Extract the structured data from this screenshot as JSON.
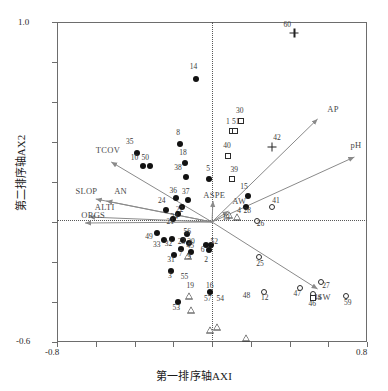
{
  "chart_data": {
    "type": "scatter",
    "title": "",
    "xlabel": "第一排序轴AXI",
    "ylabel": "第二排序轴AX2",
    "xlim": [
      -0.8,
      0.8
    ],
    "ylim": [
      -0.6,
      1.0
    ],
    "xticks": [
      -0.8,
      -0.6,
      -0.4,
      -0.2,
      0.0,
      0.2,
      0.4,
      0.6,
      0.8
    ],
    "yticks": [
      -0.6,
      -0.4,
      -0.2,
      0.0,
      0.2,
      0.4,
      0.6,
      0.8,
      1.0
    ],
    "xtick_labels": [
      "-0.8",
      "",
      "",
      "",
      "",
      "",
      "",
      "",
      "0.8"
    ],
    "ytick_labels": [
      "-0.6",
      "",
      "",
      "",
      "",
      "",
      "",
      "",
      "1.0"
    ],
    "grid": false,
    "zero_lines": true,
    "legend": "none",
    "top_note": "",
    "environmental_vectors": [
      {
        "name": "TCOV",
        "x": -0.52,
        "y": 0.3,
        "label_x": -0.6,
        "label_y": 0.36
      },
      {
        "name": "SLOP",
        "x": -0.6,
        "y": 0.115,
        "label_x": -0.705,
        "label_y": 0.155
      },
      {
        "name": "AN",
        "x": -0.545,
        "y": 0.105,
        "label_x": -0.505,
        "label_y": 0.155
      },
      {
        "name": "ALTI",
        "x": -0.635,
        "y": 0.025,
        "label_x": -0.605,
        "label_y": 0.075
      },
      {
        "name": "ORGS",
        "x": -0.655,
        "y": -0.005,
        "label_x": -0.675,
        "label_y": 0.035
      },
      {
        "name": "AP",
        "x": 0.545,
        "y": 0.515,
        "label_x": 0.595,
        "label_y": 0.565
      },
      {
        "name": "pH",
        "x": 0.735,
        "y": 0.325,
        "label_x": 0.715,
        "label_y": 0.385
      },
      {
        "name": "AW",
        "x": 0.085,
        "y": 0.055,
        "label_x": 0.105,
        "label_y": 0.105
      },
      {
        "name": "ASPE",
        "x": 0.005,
        "y": 0.105,
        "label_x": -0.045,
        "label_y": 0.135
      },
      {
        "name": "SW",
        "x": 0.545,
        "y": -0.335,
        "label_x": 0.545,
        "label_y": -0.375
      }
    ],
    "marker_types": {
      "filled-circle": "Type A sample",
      "open-circle": "Type B sample",
      "open-square": "Type C sample",
      "open-triangle": "Type D sample",
      "plus": "Type E sample"
    },
    "points": [
      {
        "id": "14",
        "x": -0.085,
        "y": 0.715,
        "marker": "filled-circle",
        "lx": -0.095,
        "ly": 0.775
      },
      {
        "id": "60",
        "x": 0.425,
        "y": 0.945,
        "marker": "plus",
        "lx": 0.388,
        "ly": 0.985
      },
      {
        "id": "35",
        "x": -0.385,
        "y": 0.345,
        "marker": "filled-circle",
        "lx": -0.425,
        "ly": 0.4
      },
      {
        "id": "8",
        "x": -0.165,
        "y": 0.39,
        "marker": "filled-circle",
        "lx": -0.175,
        "ly": 0.445
      },
      {
        "id": "10",
        "x": -0.355,
        "y": 0.28,
        "marker": "filled-circle",
        "lx": -0.4,
        "ly": 0.32
      },
      {
        "id": "50",
        "x": -0.32,
        "y": 0.28,
        "marker": "filled-circle",
        "lx": -0.345,
        "ly": 0.32
      },
      {
        "id": "18",
        "x": -0.14,
        "y": 0.295,
        "marker": "filled-circle",
        "lx": -0.15,
        "ly": 0.345
      },
      {
        "id": "38",
        "x": -0.135,
        "y": 0.225,
        "marker": "filled-circle",
        "lx": -0.175,
        "ly": 0.268
      },
      {
        "id": "5",
        "x": -0.015,
        "y": 0.215,
        "marker": "filled-circle",
        "lx": -0.02,
        "ly": 0.265
      },
      {
        "id": "30",
        "x": 0.15,
        "y": 0.505,
        "marker": "open-square",
        "lx": 0.143,
        "ly": 0.555
      },
      {
        "id": "1",
        "x": 0.103,
        "y": 0.455,
        "marker": "open-square",
        "lx": 0.082,
        "ly": 0.5
      },
      {
        "id": "51",
        "x": 0.12,
        "y": 0.455,
        "marker": "open-square",
        "lx": 0.122,
        "ly": 0.5
      },
      {
        "id": "40",
        "x": 0.085,
        "y": 0.33,
        "marker": "open-square",
        "lx": 0.078,
        "ly": 0.382
      },
      {
        "id": "39",
        "x": 0.105,
        "y": 0.215,
        "marker": "open-square",
        "lx": 0.115,
        "ly": 0.258
      },
      {
        "id": "42",
        "x": 0.31,
        "y": 0.375,
        "marker": "plus",
        "lx": 0.335,
        "ly": 0.42
      },
      {
        "id": "24",
        "x": -0.235,
        "y": 0.06,
        "marker": "filled-circle",
        "lx": -0.26,
        "ly": 0.105
      },
      {
        "id": "37",
        "x": -0.125,
        "y": 0.11,
        "marker": "filled-circle",
        "lx": -0.135,
        "ly": 0.148
      },
      {
        "id": "36",
        "x": -0.185,
        "y": 0.118,
        "marker": "filled-circle",
        "lx": -0.2,
        "ly": 0.155
      },
      {
        "id": "22",
        "x": -0.155,
        "y": 0.075,
        "marker": "filled-circle",
        "lx": -0.168,
        "ly": 0.06
      },
      {
        "id": "34",
        "x": -0.175,
        "y": 0.038,
        "marker": "filled-circle",
        "lx": -0.195,
        "ly": 0.025
      },
      {
        "id": "21",
        "x": -0.2,
        "y": 0.015,
        "marker": "filled-circle",
        "lx": -0.215,
        "ly": 0.002
      },
      {
        "id": "13",
        "x": 0.09,
        "y": 0.035,
        "marker": "open-triangle",
        "lx": 0.072,
        "ly": 0.018
      },
      {
        "id": "4",
        "x": 0.128,
        "y": 0.06,
        "marker": "open-triangle",
        "lx": 0.14,
        "ly": 0.055
      },
      {
        "id": "15",
        "x": 0.185,
        "y": 0.13,
        "marker": "filled-circle",
        "lx": 0.165,
        "ly": 0.175
      },
      {
        "id": "28",
        "x": 0.175,
        "y": 0.075,
        "marker": "filled-circle",
        "lx": 0.182,
        "ly": 0.055
      },
      {
        "id": "41",
        "x": 0.31,
        "y": 0.075,
        "marker": "open-circle",
        "lx": 0.33,
        "ly": 0.105
      },
      {
        "id": "26",
        "x": 0.23,
        "y": 0.005,
        "marker": "open-circle",
        "lx": 0.25,
        "ly": -0.012
      },
      {
        "id": "49",
        "x": -0.285,
        "y": -0.055,
        "marker": "filled-circle",
        "lx": -0.325,
        "ly": -0.075
      },
      {
        "id": "33",
        "x": -0.25,
        "y": -0.09,
        "marker": "filled-circle",
        "lx": -0.285,
        "ly": -0.115
      },
      {
        "id": "32",
        "x": -0.205,
        "y": -0.085,
        "marker": "filled-circle",
        "lx": -0.225,
        "ly": -0.112
      },
      {
        "id": "56",
        "x": -0.13,
        "y": -0.06,
        "marker": "filled-circle",
        "lx": -0.128,
        "ly": -0.048
      },
      {
        "id": "23",
        "x": -0.15,
        "y": -0.09,
        "marker": "filled-circle",
        "lx": -0.158,
        "ly": -0.1
      },
      {
        "id": "20",
        "x": -0.118,
        "y": -0.105,
        "marker": "filled-circle",
        "lx": -0.108,
        "ly": -0.098
      },
      {
        "id": "7",
        "x": -0.158,
        "y": -0.135,
        "marker": "filled-circle",
        "lx": -0.162,
        "ly": -0.16
      },
      {
        "id": "45",
        "x": -0.125,
        "y": -0.1,
        "marker": "open-triangle",
        "lx": -0.112,
        "ly": -0.12
      },
      {
        "id": "9",
        "x": -0.11,
        "y": -0.15,
        "marker": "filled-circle",
        "lx": -0.118,
        "ly": -0.175
      },
      {
        "id": "31",
        "x": -0.195,
        "y": -0.165,
        "marker": "filled-circle",
        "lx": -0.212,
        "ly": -0.192
      },
      {
        "id": "3",
        "x": -0.212,
        "y": -0.245,
        "marker": "filled-circle",
        "lx": -0.218,
        "ly": -0.272
      },
      {
        "id": "6",
        "x": -0.03,
        "y": -0.115,
        "marker": "filled-circle",
        "lx": -0.048,
        "ly": -0.142
      },
      {
        "id": "2",
        "x": -0.018,
        "y": -0.14,
        "marker": "filled-circle",
        "lx": -0.03,
        "ly": -0.19
      },
      {
        "id": "52",
        "x": -0.005,
        "y": -0.115,
        "marker": "filled-circle",
        "lx": 0.012,
        "ly": -0.102
      },
      {
        "id": "25",
        "x": 0.24,
        "y": -0.175,
        "marker": "open-circle",
        "lx": 0.248,
        "ly": -0.208
      },
      {
        "id": "27",
        "x": 0.565,
        "y": -0.3,
        "marker": "open-circle",
        "lx": 0.588,
        "ly": -0.322
      },
      {
        "id": "55",
        "x": -0.118,
        "y": -0.265,
        "marker": "open-triangle",
        "lx": -0.142,
        "ly": -0.275
      },
      {
        "id": "19",
        "x": -0.108,
        "y": -0.3,
        "marker": "open-triangle",
        "lx": -0.112,
        "ly": -0.318
      },
      {
        "id": "53",
        "x": -0.178,
        "y": -0.4,
        "marker": "filled-circle",
        "lx": -0.185,
        "ly": -0.432
      },
      {
        "id": "57",
        "x": -0.01,
        "y": -0.352,
        "marker": "filled-circle",
        "lx": -0.022,
        "ly": -0.385
      },
      {
        "id": "54",
        "x": 0.025,
        "y": -0.35,
        "marker": "open-triangle",
        "lx": 0.042,
        "ly": -0.385
      },
      {
        "id": "16",
        "x": -0.008,
        "y": -0.33,
        "marker": "open-triangle",
        "lx": -0.012,
        "ly": -0.318
      },
      {
        "id": "48",
        "x": 0.175,
        "y": -0.335,
        "marker": "open-triangle",
        "lx": 0.178,
        "ly": -0.368
      },
      {
        "id": "12",
        "x": 0.27,
        "y": -0.348,
        "marker": "open-circle",
        "lx": 0.272,
        "ly": -0.382
      },
      {
        "id": "47",
        "x": 0.452,
        "y": -0.33,
        "marker": "open-circle",
        "lx": 0.44,
        "ly": -0.362
      },
      {
        "id": "44",
        "x": 0.52,
        "y": -0.358,
        "marker": "open-circle",
        "lx": 0.545,
        "ly": -0.378
      },
      {
        "id": "46",
        "x": 0.52,
        "y": -0.378,
        "marker": "open-square",
        "lx": 0.518,
        "ly": -0.412
      },
      {
        "id": "59",
        "x": 0.69,
        "y": -0.372,
        "marker": "open-circle",
        "lx": 0.7,
        "ly": -0.405
      }
    ]
  }
}
